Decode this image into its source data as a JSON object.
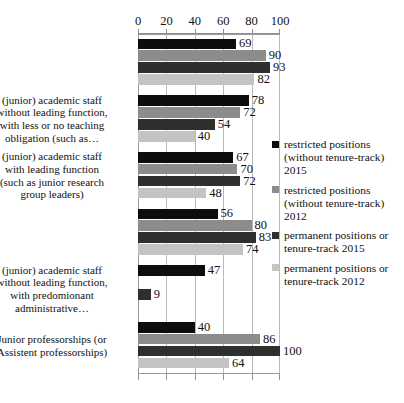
{
  "chart_data": {
    "type": "bar",
    "orientation": "horizontal",
    "title": "",
    "subtitle": "",
    "xlabel": "",
    "ylabel": "",
    "xlim": [
      0,
      100
    ],
    "xticks": [
      0,
      20,
      40,
      60,
      80,
      100
    ],
    "xtick_labels": [
      "0",
      "20",
      "40",
      "60",
      "80",
      "100"
    ],
    "grid": true,
    "grid_axis": "x",
    "axis_position": "top",
    "legend_position": "right",
    "categories": [
      "",
      "(junior) academic staff without leading function, with less or no teaching obligation (such as…",
      "(junior) academic staff with leading function (such as junior research group leaders)",
      "",
      "(junior) academic staff without leading function, with predomionant administrative…",
      "Junior professorships (or Assistent professorships)"
    ],
    "category_labels_visible": [
      {
        "index": 1,
        "lines": [
          "(junior) academic staff",
          "without leading function,",
          "with less or no teaching",
          "obligation (such as…"
        ]
      },
      {
        "index": 2,
        "lines": [
          "(junior) academic staff",
          "with leading function",
          "(such as junior research",
          "group leaders)"
        ]
      },
      {
        "index": 4,
        "lines": [
          "(junior) academic staff",
          "without leading function,",
          "with predomionant",
          "administrative…"
        ]
      },
      {
        "index": 5,
        "lines": [
          "Junior professorships (or",
          "Assistent professorships)"
        ]
      }
    ],
    "series": [
      {
        "name": "restricted positions (without tenure-track) 2015",
        "legend_lines": [
          "restricted positions",
          "(without tenure-track)",
          "2015"
        ],
        "color": "#0d0d0d",
        "values": [
          69,
          78,
          67,
          56,
          47,
          40
        ]
      },
      {
        "name": "restricted positions (without tenure-track) 2012",
        "legend_lines": [
          "restricted positions",
          "(without tenure-track)",
          "2012"
        ],
        "color": "#8c8c8c",
        "values": [
          90,
          72,
          70,
          80,
          null,
          86
        ]
      },
      {
        "name": "permanent positions or tenure-track   2015",
        "legend_lines": [
          "permanent positions or",
          "tenure-track   2015"
        ],
        "color": "#2f2f2f",
        "values": [
          93,
          54,
          72,
          83,
          9,
          100
        ]
      },
      {
        "name": "permanent positions or tenure-track   2012",
        "legend_lines": [
          "permanent positions or",
          "tenure-track   2012"
        ],
        "color": "#c4c4c4",
        "values": [
          82,
          40,
          48,
          74,
          null,
          64
        ]
      }
    ]
  }
}
